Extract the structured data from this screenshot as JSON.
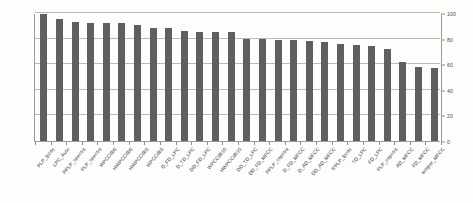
{
  "chart_data": {
    "type": "bar",
    "title": "",
    "subtitle": "",
    "xlabel": "",
    "ylabel": "",
    "ylim": [
      0,
      100
    ],
    "yticks": [
      0,
      20,
      40,
      60,
      80,
      100
    ],
    "ytick_labels": [
      "0",
      "20",
      "40",
      "60",
      "80",
      "100"
    ],
    "grid": true,
    "grid_axis": "y",
    "legend": false,
    "legend_position": "none",
    "bar_color": "#5f5f5f",
    "axis_color": "#9a9a9a",
    "gridline_color": "#b9b9b9",
    "y_axis_side": "right",
    "categories": [
      "PLP_lpcas",
      "LPC_Auto",
      "RPLP_spectra",
      "PLP_spectra",
      "WPCCdb6",
      "HWPCCdb6",
      "HWPCCdb3",
      "WPCCdb3",
      "D_FD_LPC",
      "D_TD_LPC",
      "DD_FD_LPC",
      "WPCCdb10",
      "HWPCCdb10",
      "DD_TD_LPC",
      "DD_FD_MFCC",
      "RPLP_cepstra",
      "D_FD_MFCC",
      "D_AD_MFCC",
      "DD_AD_MFCC",
      "RPLP_lpcas",
      "TD_LPC",
      "FD_LPC",
      "PLP_cepstra",
      "AD_MFCC",
      "FD_MFCC",
      "temper_MFCC"
    ],
    "values": [
      99,
      95,
      93,
      92,
      92,
      92,
      91,
      88,
      88,
      86,
      85,
      85,
      85,
      80,
      80,
      79,
      79,
      78,
      77,
      76,
      75,
      74,
      72,
      62,
      58,
      57
    ]
  }
}
